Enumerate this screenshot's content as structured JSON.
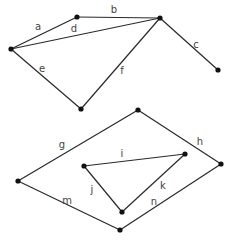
{
  "diagram": {
    "type": "graphs",
    "graphs": [
      {
        "name": "upper-graph",
        "nodes": [
          {
            "id": "A",
            "x": 11,
            "y": 49
          },
          {
            "id": "B",
            "x": 77,
            "y": 17
          },
          {
            "id": "C",
            "x": 160,
            "y": 18
          },
          {
            "id": "D",
            "x": 218,
            "y": 70
          },
          {
            "id": "E",
            "x": 81,
            "y": 109
          }
        ],
        "edges": [
          {
            "label": "a",
            "from": "A",
            "to": "B",
            "lx": 38,
            "ly": 30
          },
          {
            "label": "b",
            "from": "B",
            "to": "C",
            "lx": 114,
            "ly": 13
          },
          {
            "label": "c",
            "from": "C",
            "to": "D",
            "lx": 196,
            "ly": 48
          },
          {
            "label": "d",
            "from": "A",
            "to": "C",
            "lx": 74,
            "ly": 32
          },
          {
            "label": "e",
            "from": "A",
            "to": "E",
            "lx": 42,
            "ly": 72
          },
          {
            "label": "f",
            "from": "C",
            "to": "E",
            "lx": 122,
            "ly": 74
          }
        ]
      },
      {
        "name": "lower-graph",
        "nodes": [
          {
            "id": "F",
            "x": 138,
            "y": 110
          },
          {
            "id": "G",
            "x": 221,
            "y": 164
          },
          {
            "id": "H",
            "x": 18,
            "y": 181
          },
          {
            "id": "I",
            "x": 120,
            "y": 230
          },
          {
            "id": "J",
            "x": 84,
            "y": 166
          },
          {
            "id": "K",
            "x": 185,
            "y": 154
          },
          {
            "id": "L",
            "x": 122,
            "y": 212
          }
        ],
        "edges": [
          {
            "label": "g",
            "from": "H",
            "to": "F",
            "lx": 62,
            "ly": 148
          },
          {
            "label": "h",
            "from": "F",
            "to": "G",
            "lx": 200,
            "ly": 145
          },
          {
            "label": "i",
            "from": "J",
            "to": "K",
            "lx": 122,
            "ly": 157
          },
          {
            "label": "j",
            "from": "J",
            "to": "L",
            "lx": 92,
            "ly": 193
          },
          {
            "label": "k",
            "from": "K",
            "to": "L",
            "lx": 163,
            "ly": 189
          },
          {
            "label": "m",
            "from": "H",
            "to": "I",
            "lx": 67,
            "ly": 204
          },
          {
            "label": "n",
            "from": "I",
            "to": "G",
            "lx": 154,
            "ly": 205
          }
        ]
      }
    ]
  }
}
